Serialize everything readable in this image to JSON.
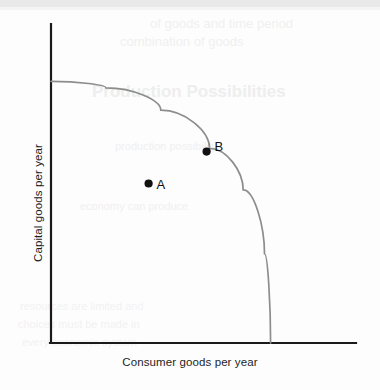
{
  "chart_data": {
    "type": "line",
    "title": "",
    "subtitle": "",
    "xlabel": "Consumer goods per year",
    "ylabel": "Capital goods per year",
    "xlim": [
      0,
      1
    ],
    "ylim": [
      0,
      1
    ],
    "grid": false,
    "legend": null,
    "axis_ticks": {
      "x": [],
      "y": []
    },
    "series": [
      {
        "name": "Production possibilities frontier",
        "type": "curve",
        "shape": "concave-to-origin",
        "color": "#8d8d8d",
        "x_intercept": 0.72,
        "y_intercept": 0.82,
        "points": [
          {
            "x": 0.0,
            "y": 0.82
          },
          {
            "x": 0.18,
            "y": 0.8
          },
          {
            "x": 0.36,
            "y": 0.73
          },
          {
            "x": 0.52,
            "y": 0.61
          },
          {
            "x": 0.63,
            "y": 0.48
          },
          {
            "x": 0.7,
            "y": 0.28
          },
          {
            "x": 0.72,
            "y": 0.0
          }
        ]
      }
    ],
    "annotations": [
      {
        "label": "A",
        "x": 0.32,
        "y": 0.5,
        "on_curve": false,
        "description": "point inside the frontier (inefficient)",
        "marker": "filled-circle",
        "color": "#111111"
      },
      {
        "label": "B",
        "x": 0.51,
        "y": 0.6,
        "on_curve": true,
        "description": "point on the frontier (efficient)",
        "marker": "filled-circle",
        "color": "#111111"
      }
    ]
  },
  "figure": {
    "background_color": "#fdfdfd",
    "axis_color": "#1a1a1a",
    "curve_color": "#8d8d8d",
    "marker_color": "#111111",
    "x_axis_label": "Consumer goods per year",
    "y_axis_label": "Capital goods per year",
    "point_a_label": "A",
    "point_b_label": "B"
  },
  "ghost_text": {
    "title": "Production Possibilities",
    "line1": "of goods and time period",
    "line2": "combination of goods",
    "line3": "production possibility",
    "line4": "economy can produce",
    "line5": "resources are limited and",
    "line6": "choices must be made in",
    "line7": "every economic system"
  }
}
